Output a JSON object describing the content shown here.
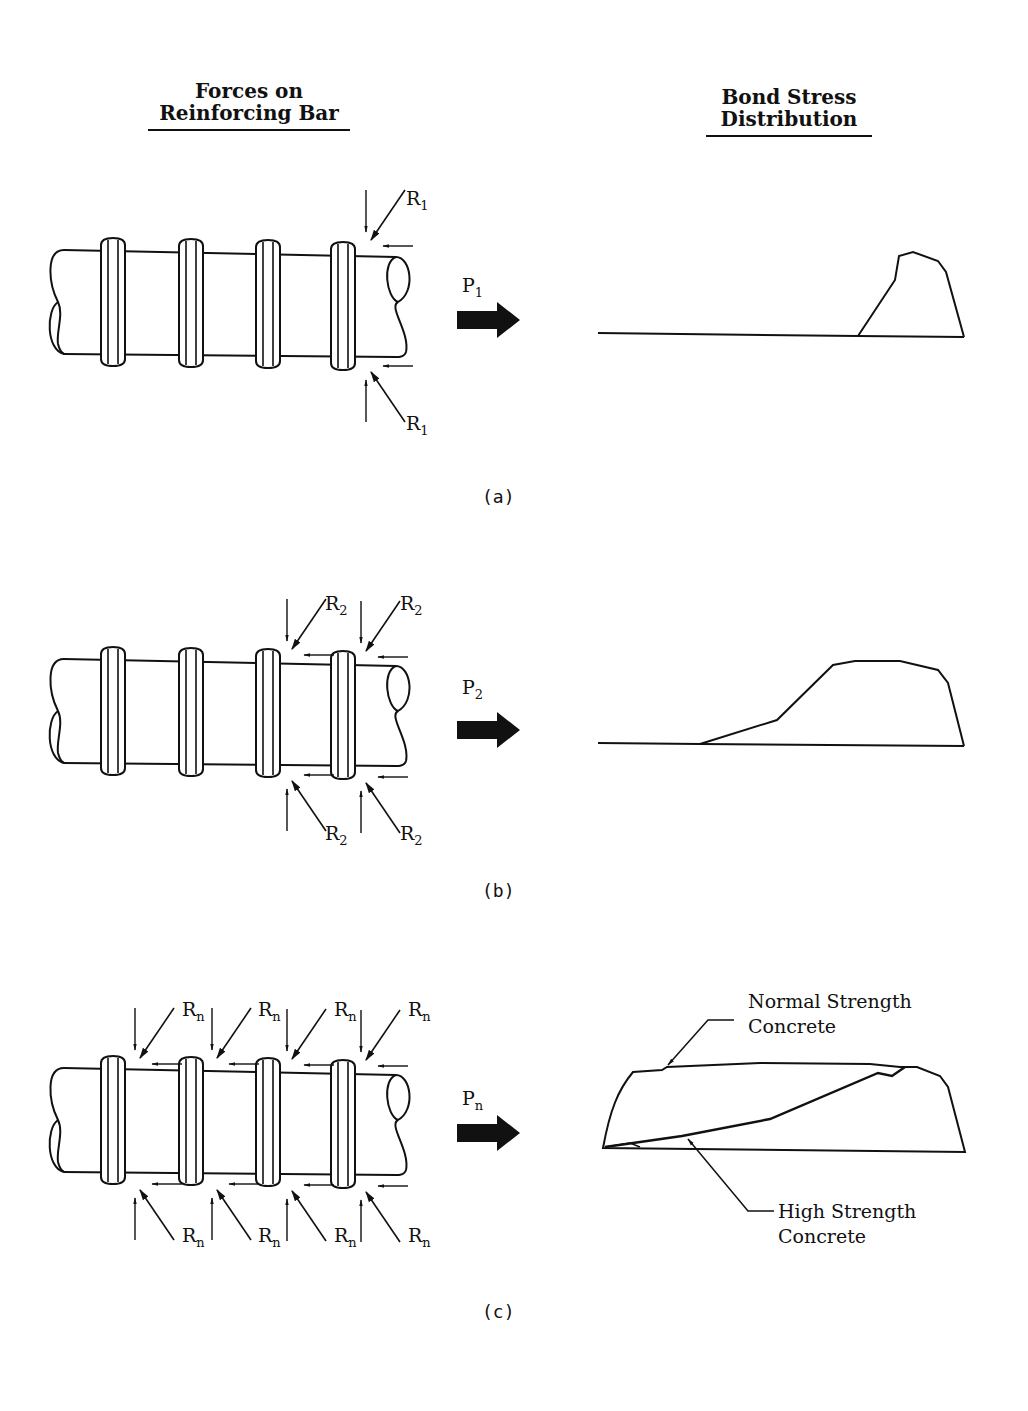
{
  "headings": {
    "left": {
      "line1": "Forces on",
      "line2": "Reinforcing Bar"
    },
    "right": {
      "line1": "Bond Stress",
      "line2": "Distribution"
    }
  },
  "panels": [
    {
      "caption": "(a)",
      "force_label": "P",
      "force_subscript": "1",
      "reaction_label": "R",
      "reaction_subscript": "1",
      "loaded_ribs": [
        4
      ],
      "stress_profile": "peak concentrated near loaded end"
    },
    {
      "caption": "(b)",
      "force_label": "P",
      "force_subscript": "2",
      "reaction_label": "R",
      "reaction_subscript": "2",
      "loaded_ribs": [
        3,
        4
      ],
      "stress_profile": "spreads over more of the bar"
    },
    {
      "caption": "(c)",
      "force_label": "P",
      "force_subscript": "n",
      "reaction_label": "R",
      "reaction_subscript": "n",
      "loaded_ribs": [
        1,
        2,
        3,
        4
      ],
      "stress_profile": "distributed along entire length",
      "annotations": {
        "normal": {
          "line1": "Normal Strength",
          "line2": "Concrete"
        },
        "high": {
          "line1": "High Strength",
          "line2": "Concrete"
        }
      }
    }
  ],
  "colors": {
    "ink": "#111111",
    "background": "#ffffff"
  }
}
